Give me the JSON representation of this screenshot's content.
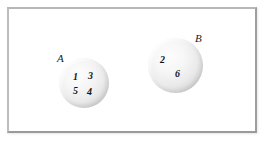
{
  "diagram": {
    "type": "set-diagram",
    "universe": {
      "name": "universal-set-frame",
      "shape": "rectangle"
    },
    "sets": [
      {
        "id": "A",
        "label": "A",
        "label_position": "upper-left-outside",
        "shape": "circle",
        "elements": [
          {
            "value": "1",
            "x": 14,
            "y": 14
          },
          {
            "value": "3",
            "x": 29,
            "y": 13
          },
          {
            "value": "5",
            "x": 14,
            "y": 28
          },
          {
            "value": "4",
            "x": 28,
            "y": 29
          }
        ]
      },
      {
        "id": "B",
        "label": "B",
        "label_position": "upper-right-outside",
        "shape": "circle",
        "elements": [
          {
            "value": "2",
            "x": 12,
            "y": 17
          },
          {
            "value": "6",
            "x": 27,
            "y": 31
          }
        ]
      }
    ],
    "colors": {
      "frame_border": "#9e9e9e",
      "circle_fill_light": "#fdfdfd",
      "circle_fill_dark": "#ababab",
      "text": "#141414",
      "background": "#ffffff"
    }
  }
}
